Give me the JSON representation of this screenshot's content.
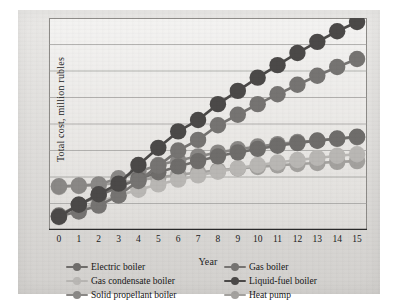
{
  "chart_data": {
    "type": "line",
    "title": "",
    "xlabel": "Year",
    "ylabel": "Total cost, million rubles",
    "x": [
      0,
      1,
      2,
      3,
      4,
      5,
      6,
      7,
      8,
      9,
      10,
      11,
      12,
      13,
      14,
      15
    ],
    "categories": [
      "0",
      "1",
      "2",
      "3",
      "4",
      "5",
      "6",
      "7",
      "8",
      "9",
      "10",
      "11",
      "12",
      "13",
      "14",
      "15"
    ],
    "xlim": [
      -0.5,
      15.5
    ],
    "ylim": [
      0,
      8
    ],
    "grid": "horizontal",
    "gridlines": 7,
    "yticklabels": [],
    "legend_position": "bottom",
    "legend_columns": 2,
    "marker": "circle",
    "series": [
      {
        "name": "Electric boiler",
        "color": "#6f6d6b",
        "values": [
          0.55,
          0.95,
          1.3,
          1.62,
          1.92,
          2.18,
          2.4,
          2.6,
          2.78,
          2.93,
          3.06,
          3.18,
          3.28,
          3.37,
          3.45,
          3.52
        ]
      },
      {
        "name": "Gas boiler",
        "color": "#767472",
        "values": [
          0.52,
          0.7,
          0.92,
          1.3,
          1.85,
          2.42,
          3.0,
          3.4,
          3.95,
          4.35,
          4.75,
          5.12,
          5.48,
          5.82,
          6.15,
          6.45
        ]
      },
      {
        "name": "Gas condensate boiler",
        "color": "#b9b7b4",
        "values": [
          0.48,
          0.78,
          1.05,
          1.3,
          1.52,
          1.72,
          1.9,
          2.06,
          2.2,
          2.33,
          2.45,
          2.55,
          2.64,
          2.72,
          2.8,
          2.86
        ]
      },
      {
        "name": "Liquid-fuel boiler",
        "color": "#4b4948",
        "values": [
          0.5,
          0.95,
          1.35,
          1.75,
          2.45,
          3.1,
          3.72,
          4.15,
          4.75,
          5.25,
          5.75,
          6.22,
          6.68,
          7.1,
          7.5,
          7.85
        ]
      },
      {
        "name": "Solid propellant boiler",
        "color": "#8a8886",
        "values": [
          1.65,
          1.68,
          1.72,
          1.95,
          2.2,
          2.45,
          2.62,
          2.78,
          2.92,
          3.05,
          3.15,
          3.24,
          3.32,
          3.38,
          3.44,
          3.5
        ]
      },
      {
        "name": "Heat pump",
        "color": "#a3a19e",
        "values": [
          1.62,
          1.66,
          1.7,
          1.78,
          1.88,
          1.98,
          2.08,
          2.17,
          2.25,
          2.32,
          2.38,
          2.44,
          2.49,
          2.53,
          2.57,
          2.6
        ]
      }
    ]
  },
  "legend": {
    "items": [
      {
        "label": "Electric boiler"
      },
      {
        "label": "Gas boiler"
      },
      {
        "label": "Gas condensate boiler"
      },
      {
        "label": "Liquid-fuel boiler"
      },
      {
        "label": "Solid propellant boiler"
      },
      {
        "label": "Heat pump"
      }
    ]
  },
  "axes": {
    "x_title": "Year",
    "y_title": "Total cost, million rubles"
  }
}
